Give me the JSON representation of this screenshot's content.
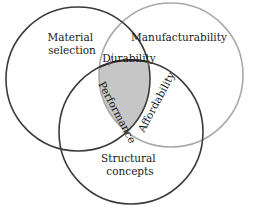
{
  "diagram": {
    "type": "venn",
    "circles": [
      {
        "id": "material",
        "label_lines": [
          "Material",
          "selection"
        ],
        "stroke": "#3a3a3a"
      },
      {
        "id": "manufacturability",
        "label_lines": [
          "Manufacturability"
        ],
        "stroke": "#a8a8a8"
      },
      {
        "id": "structural",
        "label_lines": [
          "Structural",
          "concepts"
        ],
        "stroke": "#3a3a3a"
      }
    ],
    "intersections": {
      "material_manufacturability": "Durability",
      "material_structural": "Performance",
      "manufacturability_structural": "Affordability"
    },
    "center_fill": "#c8c8c8"
  }
}
